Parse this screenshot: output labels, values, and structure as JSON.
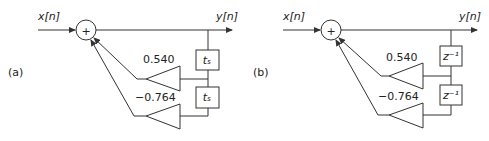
{
  "diagrams": [
    {
      "panel_label": "(a)",
      "input_label": "x[n]",
      "output_label": "y[n]",
      "adder_symbol": "+",
      "gains": [
        "0.540",
        "−0.764"
      ],
      "delay_labels": [
        "tₛ",
        "tₛ"
      ]
    },
    {
      "panel_label": "(b)",
      "input_label": "x[n]",
      "output_label": "y[n]",
      "adder_symbol": "+",
      "gains": [
        "0.540",
        "−0.764"
      ],
      "delay_labels": [
        "z⁻¹",
        "z⁻¹"
      ]
    }
  ],
  "colors": {
    "stroke": "#333333",
    "text": "#222222",
    "background": "#ffffff"
  }
}
